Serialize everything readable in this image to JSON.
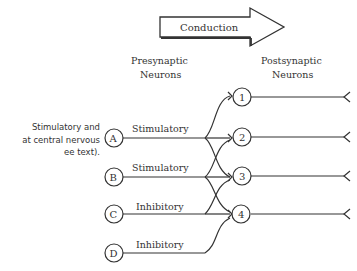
{
  "conduction_arrow": {
    "label": "Conduction"
  },
  "headers": {
    "presynaptic": [
      "Presynaptic",
      "Neurons"
    ],
    "postsynaptic": [
      "Postsynaptic",
      "Neurons"
    ]
  },
  "caption_fragment": [
    "Stimulatory and",
    "at central nervous",
    "ee text)."
  ],
  "presynaptic_neurons": [
    {
      "id": "A",
      "type": "Stimulatory",
      "targets": [
        "1",
        "2",
        "3"
      ]
    },
    {
      "id": "B",
      "type": "Stimulatory",
      "targets": [
        "2",
        "3",
        "4"
      ]
    },
    {
      "id": "C",
      "type": "Inhibitory",
      "targets": [
        "3",
        "4"
      ]
    },
    {
      "id": "D",
      "type": "Inhibitory",
      "targets": [
        "4"
      ]
    }
  ],
  "postsynaptic_neurons": [
    {
      "id": "1"
    },
    {
      "id": "2"
    },
    {
      "id": "3"
    },
    {
      "id": "4"
    }
  ],
  "colors": {
    "line": "#333333",
    "background": "#ffffff"
  }
}
